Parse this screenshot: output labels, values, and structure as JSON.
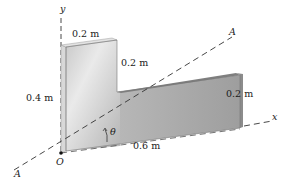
{
  "figure": {
    "axes": {
      "x_label": "x",
      "y_label": "y",
      "origin_label": "O",
      "axis_A_end_label": "A",
      "axis_A_start_label": "A",
      "angle_label": "θ"
    },
    "dimensions": {
      "top_width": "0.2 m",
      "step_height": "0.2 m",
      "left_height": "0.4 m",
      "right_height": "0.2 m",
      "bottom_length": "0.6 m"
    },
    "colors": {
      "face_light": "#e4e4e4",
      "face_mid": "#b9b9b9",
      "face_dark": "#9a9a9a",
      "edge_top": "#d2d2d2",
      "side_dark": "#8c8c8c",
      "line": "#333333"
    }
  }
}
